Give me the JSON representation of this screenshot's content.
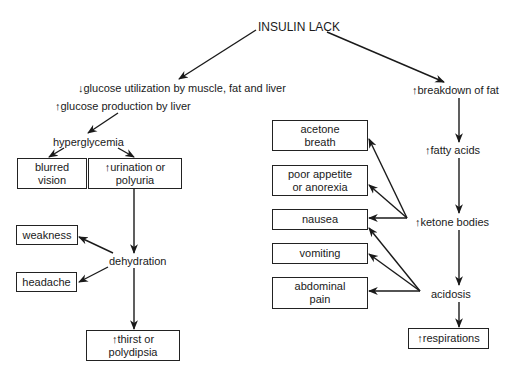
{
  "diagram": {
    "root": "INSULIN LACK",
    "left_branch": {
      "glucose_utilization": "↓glucose utilization by muscle, fat and liver",
      "glucose_production": "↑glucose production by liver",
      "hyperglycemia": "hyperglycemia",
      "blurred_vision": [
        "blurred",
        "vision"
      ],
      "urination": [
        "↑urination or",
        "polyuria"
      ],
      "dehydration": "dehydration",
      "weakness": "weakness",
      "headache": "headache",
      "thirst": [
        "↑thirst or",
        "polydipsia"
      ]
    },
    "right_branch": {
      "breakdown_of_fat": "↑breakdown of fat",
      "fatty_acids": "↑fatty acids",
      "ketone_bodies": "↑ketone bodies",
      "acidosis": "acidosis",
      "respirations": "↑respirations",
      "symptoms": {
        "acetone_breath": [
          "acetone",
          "breath"
        ],
        "poor_appetite": [
          "poor appetite",
          "or anorexia"
        ],
        "nausea": "nausea",
        "vomiting": "vomiting",
        "abdominal_pain": [
          "abdominal",
          "pain"
        ]
      }
    }
  }
}
